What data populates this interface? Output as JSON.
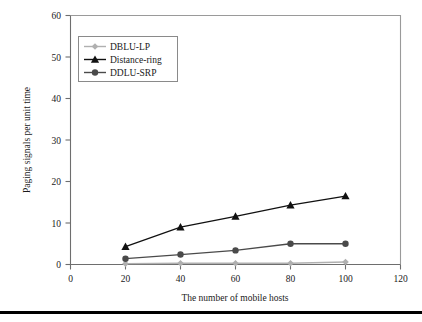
{
  "chart_data": {
    "type": "line",
    "title": "",
    "xlabel": "The number of mobile hosts",
    "ylabel": "Paging signals per unit time",
    "x": [
      20,
      40,
      60,
      80,
      100
    ],
    "xlim": [
      0,
      120
    ],
    "ylim": [
      0,
      60
    ],
    "xticks": [
      "0",
      "20",
      "40",
      "60",
      "80",
      "100",
      "120"
    ],
    "yticks": [
      "0",
      "10",
      "20",
      "30",
      "40",
      "50",
      "60"
    ],
    "grid": false,
    "legend_position": "upper-left",
    "series": [
      {
        "name": "DBLU-LP",
        "values": [
          0.2,
          0.3,
          0.3,
          0.3,
          0.6
        ],
        "color": "#b0b0b0",
        "marker": "diamond"
      },
      {
        "name": "Distance-ring",
        "values": [
          4.3,
          9.0,
          11.6,
          14.3,
          16.5
        ],
        "color": "#111111",
        "marker": "triangle"
      },
      {
        "name": "DDLU-SRP",
        "values": [
          1.4,
          2.4,
          3.4,
          5.0,
          5.0
        ],
        "color": "#4a4a4a",
        "marker": "circle"
      }
    ]
  }
}
